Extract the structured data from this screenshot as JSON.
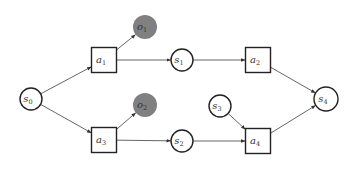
{
  "diagram": {
    "type": "dynamic-decision-network",
    "colors": {
      "stroke": "#222222",
      "edge": "#555555",
      "observation_fill": "#808080",
      "background": "#ffffff"
    },
    "nodes": [
      {
        "id": "s0",
        "kind": "state",
        "base": "s",
        "sub": "0",
        "cx": 31,
        "cy": 99,
        "r": 11
      },
      {
        "id": "a1",
        "kind": "action",
        "base": "a",
        "sub": "1",
        "cx": 104,
        "cy": 60,
        "size": 25
      },
      {
        "id": "o1",
        "kind": "observation",
        "base": "o",
        "sub": "1",
        "cx": 145,
        "cy": 27,
        "r": 12
      },
      {
        "id": "s1",
        "kind": "state",
        "base": "s",
        "sub": "1",
        "cx": 182,
        "cy": 60,
        "r": 11
      },
      {
        "id": "a2",
        "kind": "action",
        "base": "a",
        "sub": "2",
        "cx": 258,
        "cy": 60,
        "size": 25
      },
      {
        "id": "s4",
        "kind": "state",
        "base": "s",
        "sub": "4",
        "cx": 326,
        "cy": 99,
        "r": 12
      },
      {
        "id": "a3",
        "kind": "action",
        "base": "a",
        "sub": "3",
        "cx": 104,
        "cy": 140,
        "size": 25
      },
      {
        "id": "o2",
        "kind": "observation",
        "base": "o",
        "sub": "2",
        "cx": 145,
        "cy": 105,
        "r": 12
      },
      {
        "id": "s2",
        "kind": "state",
        "base": "s",
        "sub": "2",
        "cx": 182,
        "cy": 141,
        "r": 11
      },
      {
        "id": "s3",
        "kind": "state",
        "base": "s",
        "sub": "3",
        "cx": 220,
        "cy": 106,
        "r": 11
      },
      {
        "id": "a4",
        "kind": "action",
        "base": "a",
        "sub": "4",
        "cx": 258,
        "cy": 141,
        "size": 25
      }
    ],
    "edges": [
      {
        "from": "s0",
        "to": "a1"
      },
      {
        "from": "s0",
        "to": "a3"
      },
      {
        "from": "a1",
        "to": "o1"
      },
      {
        "from": "a1",
        "to": "s1"
      },
      {
        "from": "s1",
        "to": "a2"
      },
      {
        "from": "a2",
        "to": "s4"
      },
      {
        "from": "a3",
        "to": "o2"
      },
      {
        "from": "a3",
        "to": "s2"
      },
      {
        "from": "s2",
        "to": "a4"
      },
      {
        "from": "s3",
        "to": "a4"
      },
      {
        "from": "a4",
        "to": "s4"
      }
    ]
  }
}
